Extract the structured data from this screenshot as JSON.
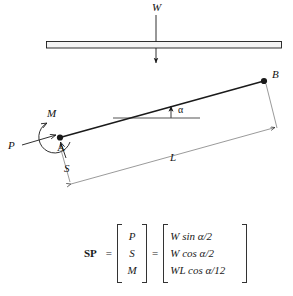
{
  "figure": {
    "title": "",
    "top_beam": {
      "load_label": "W",
      "description": "horizontal beam with downward point load W at midspan"
    },
    "inclined_member": {
      "point_a_label": "A",
      "point_b_label": "B",
      "angle_label": "α",
      "length_label": "L",
      "axial_force_label": "P",
      "shear_force_label": "S",
      "moment_label": "M"
    },
    "colors": {
      "line": "#1a1a1a",
      "beam_fill": "#f2f2f2",
      "background": "#ffffff",
      "reference_line": "#8c8c8c"
    }
  },
  "equation": {
    "name": "SP",
    "equals_1": "=",
    "equals_2": "=",
    "vector": [
      "P",
      "S",
      "M"
    ],
    "expressions": [
      "W sin α/2",
      "W cos α/2",
      "WL cos α/12"
    ]
  }
}
